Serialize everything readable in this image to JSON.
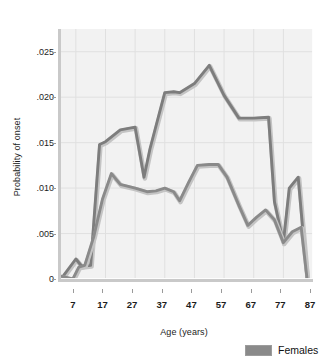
{
  "chart_data": {
    "type": "line",
    "title": "",
    "xlabel": "Age (years)",
    "ylabel": "Probability of onset",
    "xlim": [
      2,
      87
    ],
    "ylim": [
      0,
      0.0275
    ],
    "grid": true,
    "legend_position": "bottom-right",
    "xticks": [
      7,
      17,
      27,
      37,
      47,
      57,
      67,
      77,
      87
    ],
    "xtick_labels": [
      "7",
      "17",
      "27",
      "37",
      "47",
      "57",
      "67",
      "77",
      "87"
    ],
    "yticks": [
      0,
      0.005,
      0.01,
      0.015,
      0.02,
      0.025
    ],
    "ytick_labels": [
      "0",
      ".005",
      ".010",
      ".015",
      ".020",
      ".025"
    ],
    "series": [
      {
        "name": "Males",
        "color": "#7d7d7d",
        "x": [
          2,
          7,
          9,
          12,
          15,
          17,
          22,
          27,
          30,
          32,
          37,
          40,
          42,
          47,
          52,
          57,
          62,
          67,
          72,
          74,
          77,
          79,
          82,
          85
        ],
        "y": [
          0.0,
          0.0022,
          0.0014,
          0.0015,
          0.0148,
          0.0151,
          0.0164,
          0.0167,
          0.0112,
          0.0143,
          0.0205,
          0.0206,
          0.0205,
          0.0215,
          0.0235,
          0.0202,
          0.0177,
          0.0177,
          0.0178,
          0.0085,
          0.004,
          0.01,
          0.0112,
          0.0
        ]
      },
      {
        "name": "Females",
        "color": "#8a8a8a",
        "x": [
          2,
          6,
          8,
          10,
          13,
          16,
          19,
          22,
          27,
          31,
          34,
          37,
          40,
          42,
          45,
          48,
          52,
          55,
          58,
          62,
          65,
          68,
          71,
          74,
          77,
          80,
          83,
          85
        ],
        "y": [
          0.0003,
          0.0,
          0.0013,
          0.0015,
          0.0046,
          0.0088,
          0.0116,
          0.0104,
          0.01,
          0.0096,
          0.0097,
          0.01,
          0.0096,
          0.0086,
          0.0106,
          0.0125,
          0.0126,
          0.0126,
          0.0112,
          0.0081,
          0.0059,
          0.0068,
          0.0076,
          0.0065,
          0.004,
          0.0052,
          0.0057,
          0.0
        ]
      }
    ],
    "legend": [
      {
        "label": "Females",
        "color": "#8a8a8a"
      }
    ]
  },
  "plot": {
    "background": "#f2f2f2",
    "gridline_color": "#e0e0e0",
    "frame_color": "#c9c9c9"
  }
}
